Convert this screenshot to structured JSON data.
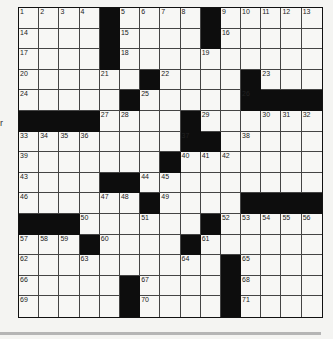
{
  "puzzle": {
    "rows": 15,
    "cols": 15,
    "grid": [
      "....#....#.....",
      "....#....#.....",
      "....#..........",
      "......#....#...",
      ".....#.....####",
      "####....#......",
      "........##.....",
      ".......#.......",
      "....##.........",
      "......#....####",
      "###......#.....",
      "...#....#......",
      "..........#....",
      ".....#....#....",
      ".....#....#...."
    ],
    "numbers": [
      [
        0,
        0,
        1
      ],
      [
        0,
        1,
        2
      ],
      [
        0,
        2,
        3
      ],
      [
        0,
        3,
        4
      ],
      [
        0,
        5,
        5
      ],
      [
        0,
        6,
        6
      ],
      [
        0,
        7,
        7
      ],
      [
        0,
        8,
        8
      ],
      [
        0,
        10,
        9
      ],
      [
        0,
        11,
        10
      ],
      [
        0,
        12,
        11
      ],
      [
        0,
        13,
        12
      ],
      [
        0,
        14,
        13
      ],
      [
        1,
        0,
        14
      ],
      [
        1,
        5,
        15
      ],
      [
        1,
        10,
        16
      ],
      [
        2,
        0,
        17
      ],
      [
        2,
        5,
        18
      ],
      [
        2,
        9,
        19
      ],
      [
        3,
        0,
        20
      ],
      [
        3,
        4,
        21
      ],
      [
        3,
        7,
        22
      ],
      [
        3,
        12,
        23
      ],
      [
        4,
        0,
        24
      ],
      [
        4,
        6,
        25
      ],
      [
        4,
        11,
        26
      ],
      [
        5,
        4,
        27
      ],
      [
        5,
        5,
        28
      ],
      [
        5,
        9,
        29
      ],
      [
        5,
        12,
        30
      ],
      [
        5,
        13,
        31
      ],
      [
        5,
        14,
        32
      ],
      [
        6,
        0,
        33
      ],
      [
        6,
        1,
        34
      ],
      [
        6,
        2,
        35
      ],
      [
        6,
        3,
        36
      ],
      [
        6,
        8,
        37
      ],
      [
        6,
        11,
        38
      ],
      [
        7,
        0,
        39
      ],
      [
        7,
        8,
        40
      ],
      [
        7,
        9,
        41
      ],
      [
        7,
        10,
        42
      ],
      [
        8,
        0,
        43
      ],
      [
        8,
        6,
        44
      ],
      [
        8,
        7,
        45
      ],
      [
        9,
        0,
        46
      ],
      [
        9,
        4,
        47
      ],
      [
        9,
        5,
        48
      ],
      [
        9,
        7,
        49
      ],
      [
        10,
        3,
        50
      ],
      [
        10,
        6,
        51
      ],
      [
        10,
        10,
        52
      ],
      [
        10,
        11,
        53
      ],
      [
        10,
        12,
        54
      ],
      [
        10,
        13,
        55
      ],
      [
        10,
        14,
        56
      ],
      [
        11,
        0,
        57
      ],
      [
        11,
        1,
        58
      ],
      [
        11,
        2,
        59
      ],
      [
        11,
        4,
        60
      ],
      [
        11,
        9,
        61
      ],
      [
        12,
        0,
        62
      ],
      [
        12,
        3,
        63
      ],
      [
        12,
        8,
        64
      ],
      [
        12,
        11,
        65
      ],
      [
        13,
        0,
        66
      ],
      [
        13,
        6,
        67
      ],
      [
        13,
        11,
        68
      ],
      [
        14,
        0,
        69
      ],
      [
        14,
        6,
        70
      ],
      [
        14,
        11,
        71
      ]
    ]
  },
  "margin_text": "r"
}
